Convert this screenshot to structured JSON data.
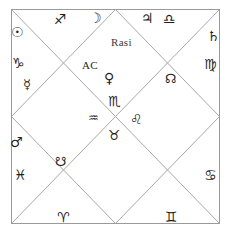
{
  "chart": {
    "title": "Rasi",
    "ascendant_label": "AC",
    "style": "north-indian-diamond",
    "border_color": "#9a9a9a",
    "line_color": "#a8a8a8",
    "background": "#ffffff",
    "glyph_color": "#1f1f1f"
  },
  "signs": [
    {
      "name": "sagittarius",
      "glyph": "♐",
      "house": 1
    },
    {
      "name": "capricorn",
      "glyph": "♑",
      "house": 2
    },
    {
      "name": "aquarius",
      "glyph": "♒",
      "house": 3
    },
    {
      "name": "pisces",
      "glyph": "♓",
      "house": 4
    },
    {
      "name": "aries",
      "glyph": "♈",
      "house": 5
    },
    {
      "name": "taurus",
      "glyph": "♉",
      "house": 6
    },
    {
      "name": "gemini",
      "glyph": "♊",
      "house": 7
    },
    {
      "name": "cancer",
      "glyph": "♋",
      "house": 8
    },
    {
      "name": "leo",
      "glyph": "♌",
      "house": 9
    },
    {
      "name": "virgo",
      "glyph": "♍",
      "house": 10
    },
    {
      "name": "libra",
      "glyph": "♎",
      "house": 11
    },
    {
      "name": "scorpio",
      "glyph": "♏",
      "house": 12
    }
  ],
  "planets": [
    {
      "name": "sun",
      "glyph": "☉"
    },
    {
      "name": "moon",
      "glyph": "☽"
    },
    {
      "name": "mercury",
      "glyph": "☿"
    },
    {
      "name": "venus",
      "glyph": "♀"
    },
    {
      "name": "mars",
      "glyph": "♂"
    },
    {
      "name": "jupiter",
      "glyph": "♃"
    },
    {
      "name": "saturn",
      "glyph": "♄"
    },
    {
      "name": "rahu",
      "glyph": "☊"
    },
    {
      "name": "ketu",
      "glyph": "☋"
    }
  ],
  "marks": {
    "sun": "☉",
    "moon": "☽",
    "mercury": "☿",
    "venus": "♀",
    "mars": "♂",
    "jupiter": "♃",
    "saturn": "♄",
    "rahu": "☊",
    "ketu": "☋",
    "aries": "♈",
    "taurus": "♉",
    "gemini": "♊",
    "cancer": "♋",
    "leo": "♌",
    "virgo": "♍",
    "libra": "♎",
    "scorpio": "♏",
    "sagittarius": "♐",
    "capricorn": "♑",
    "aquarius": "♒",
    "pisces": "♓"
  }
}
